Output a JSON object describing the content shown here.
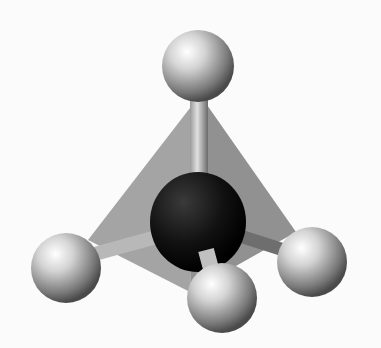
{
  "image": {
    "subject": "tetrahedral molecule ball-and-stick model",
    "atoms": [
      {
        "role": "central",
        "color": "#111111"
      },
      {
        "role": "top",
        "color": "#c8c8c8"
      },
      {
        "role": "left",
        "color": "#c8c8c8"
      },
      {
        "role": "right",
        "color": "#c8c8c8"
      },
      {
        "role": "front",
        "color": "#c8c8c8"
      }
    ],
    "colors": {
      "background": "#fbfbfb",
      "tetrahedron_face": "#8c8c8c",
      "bond": "#b4b4b4"
    }
  }
}
